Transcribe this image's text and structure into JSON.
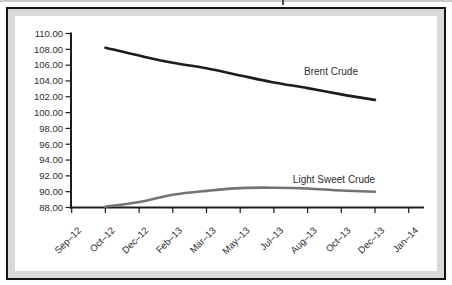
{
  "style": {
    "axis_color": "#1c1c1c",
    "text_color": "#2e2e2e",
    "frame_border_color": "#141414",
    "frame_mat_color": "#d9d9d9",
    "plot_bg": "#ffffff",
    "artifact_line_color": "#c9c9c9",
    "artifact_tick_color": "#4d4d4d"
  },
  "chart_data": {
    "type": "line",
    "categories": [
      "Sep–12",
      "Oct–12",
      "Dec–12",
      "Feb–13",
      "Mar–13",
      "May–13",
      "Jul–13",
      "Aug–13",
      "Oct–13",
      "Dec–13",
      "Jan–14"
    ],
    "series": [
      {
        "name": "Brent Crude",
        "color": "#1c1c1c",
        "values": [
          null,
          108.2,
          107.2,
          106.3,
          105.6,
          104.7,
          103.8,
          103.1,
          102.3,
          101.6,
          null
        ]
      },
      {
        "name": "Light Sweet Crude",
        "color": "#737373",
        "values": [
          null,
          88.1,
          88.7,
          89.6,
          90.1,
          90.45,
          90.5,
          90.4,
          90.15,
          90.0,
          null
        ]
      }
    ],
    "ylim": [
      88,
      110
    ],
    "ytick_step": 2,
    "ytick_labels": [
      "110.00",
      "108.00",
      "106.00",
      "104.00",
      "102.00",
      "100.00",
      "98.00",
      "96.00",
      "94.00",
      "92.00",
      "90.00",
      "88.00"
    ],
    "xlabel": "",
    "ylabel": "",
    "grid": false,
    "legend": "inline-labels",
    "annotations": [
      {
        "series": 0,
        "x": 331,
        "y": 75
      },
      {
        "series": 1,
        "x": 334,
        "y": 183
      }
    ]
  }
}
